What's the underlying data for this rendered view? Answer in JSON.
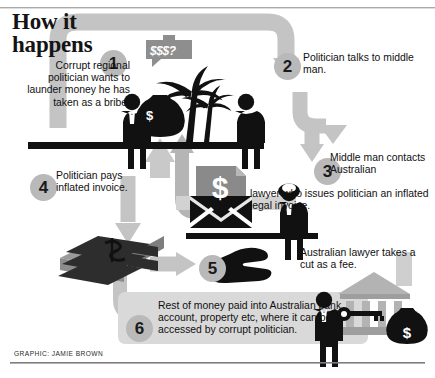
{
  "header": {
    "title_line1": "How it",
    "title_line2": "happens"
  },
  "steps": [
    {
      "number": "1",
      "text": "Corrupt regional politician wants to launder money he has taken as a bribe.",
      "align": "right"
    },
    {
      "number": "2",
      "text": "Politician talks to middle man.",
      "align": "left"
    },
    {
      "number": "3",
      "text_part1": "Middle man contacts Australian",
      "text_part2": "lawyer  who issues politician an inflated legal invoice.",
      "align": "left"
    },
    {
      "number": "4",
      "text": "Politician pays inflated invoice.",
      "align": "left"
    },
    {
      "number": "5",
      "text": "Australian lawyer takes a cut as a fee.",
      "align": "left"
    },
    {
      "number": "6",
      "text": "Rest of money paid into Australian bank account, property etc, where it can be accessed by corrupt politician.",
      "align": "left"
    }
  ],
  "illustration": {
    "speech_bubble": "$$$?",
    "money_bag_symbol": "$",
    "envelope_document_symbol": "$",
    "cash_stack_symbol": "$",
    "vault_money_bag_symbol": "$",
    "icons": [
      "politician-figure-icon",
      "palm-tree-icon",
      "money-bag-icon",
      "middle-man-figure-icon",
      "speech-bubble-icon",
      "lawyer-wig-figure-icon",
      "envelope-invoice-icon",
      "cash-stack-icon",
      "open-hand-icon",
      "key-icon",
      "bank-building-icon"
    ]
  },
  "credit": {
    "text": "GRAPHIC: JAMIE BROWN"
  },
  "colors": {
    "arrow_gray": "#c0c0c0",
    "arrow_gray_dark": "#a9a9a9",
    "disc_gray": "#b9b9b9",
    "ink": "#111111",
    "panel_gray": "#d8d8d8",
    "background": "#ffffff"
  }
}
